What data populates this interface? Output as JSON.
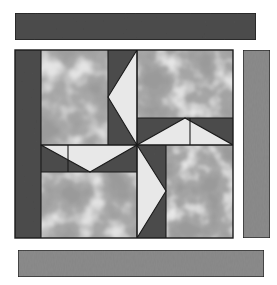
{
  "figure": {
    "name": "pinwheel-quilt-block-diagram",
    "type": "quilt-block-illustration",
    "canvas": {
      "width": 277,
      "height": 285
    },
    "background_color": "#ffffff"
  },
  "palette": {
    "dark_gray": "#4d4d4d",
    "medium_gray": "#8c8c8c",
    "fabric_base": "#9a9a9a",
    "fabric_mottle_light": "#d8d8d8",
    "fabric_mottle_lighter": "#f0f0f0",
    "fabric_mottle_dark": "#7f7f7f",
    "blade_light": "#e8e8e8",
    "outline": "#1a1a1a"
  },
  "pieces": {
    "top_sashing_strip": {
      "label": "top-sashing-strip",
      "fabric": "dark_gray",
      "x": 15,
      "y": 13,
      "width": 241,
      "height": 27
    },
    "right_sashing_strip": {
      "label": "right-sashing-strip",
      "fabric": "medium_gray",
      "x": 243,
      "y": 50,
      "width": 27,
      "height": 188
    },
    "bottom_sashing_strip": {
      "label": "bottom-sashing-strip",
      "fabric": "medium_gray",
      "x": 18,
      "y": 250,
      "width": 246,
      "height": 27
    },
    "block_body": {
      "label": "pinwheel-block-body",
      "x": 15,
      "y": 50,
      "width": 218,
      "height": 188
    },
    "left_inner_strip": {
      "label": "left-inner-dark-strip",
      "fabric": "dark_gray",
      "x": 15,
      "y": 50,
      "width": 26,
      "height": 188
    }
  },
  "pinwheel": {
    "label": "center-pinwheel",
    "center": {
      "x": 137,
      "y": 145
    },
    "blade_count": 4,
    "blades": [
      {
        "name": "blade-top",
        "light_fill": "blade_light",
        "dark_fill": "dark_gray"
      },
      {
        "name": "blade-right",
        "light_fill": "blade_light",
        "dark_fill": "dark_gray"
      },
      {
        "name": "blade-bottom",
        "light_fill": "blade_light",
        "dark_fill": "dark_gray"
      },
      {
        "name": "blade-left",
        "light_fill": "blade_light",
        "dark_fill": "dark_gray"
      }
    ]
  },
  "corner_patches": [
    {
      "name": "corner-patch-top-left",
      "fabric": "fabric_base"
    },
    {
      "name": "corner-patch-top-right",
      "fabric": "fabric_base"
    },
    {
      "name": "corner-patch-bottom-left",
      "fabric": "fabric_base"
    },
    {
      "name": "corner-patch-bottom-right",
      "fabric": "fabric_base"
    }
  ]
}
